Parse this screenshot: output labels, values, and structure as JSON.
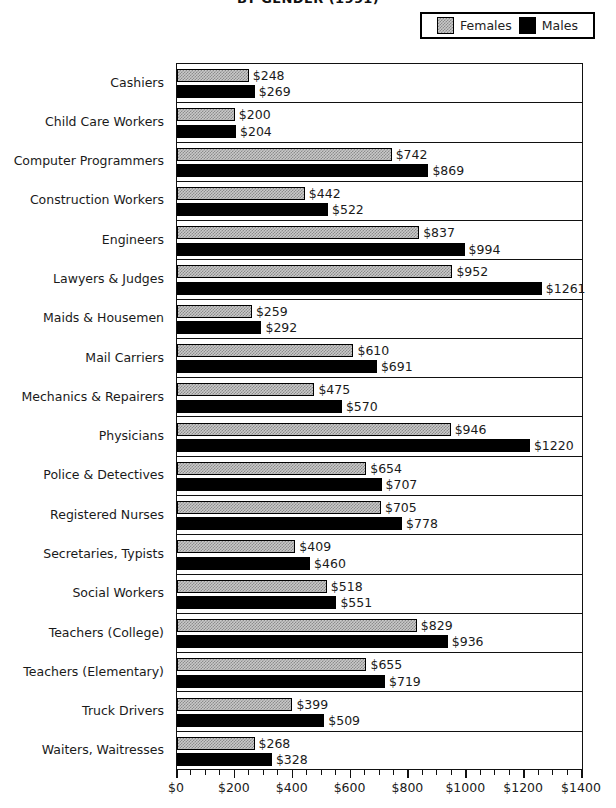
{
  "chart_data": {
    "type": "bar",
    "orientation": "horizontal",
    "title": "BY GENDER (1991)",
    "xlabel": "",
    "ylabel": "",
    "xlim": [
      0,
      1400
    ],
    "x_ticks": [
      "$0",
      "$200",
      "$400",
      "$600",
      "$800",
      "$1000",
      "$1200",
      "$1400"
    ],
    "x_tick_values": [
      0,
      200,
      400,
      600,
      800,
      1000,
      1200,
      1400
    ],
    "minor_tick_step": 50,
    "grid": false,
    "legend_position": "top-right",
    "value_prefix": "$",
    "categories": [
      "Cashiers",
      "Child Care Workers",
      "Computer Programmers",
      "Construction Workers",
      "Engineers",
      "Lawyers & Judges",
      "Maids & Housemen",
      "Mail Carriers",
      "Mechanics & Repairers",
      "Physicians",
      "Police & Detectives",
      "Registered Nurses",
      "Secretaries, Typists",
      "Social Workers",
      "Teachers (College)",
      "Teachers (Elementary)",
      "Truck Drivers",
      "Waiters, Waitresses"
    ],
    "series": [
      {
        "name": "Females",
        "color": "#c9c9c9",
        "values": [
          248,
          200,
          742,
          442,
          837,
          952,
          259,
          610,
          475,
          946,
          654,
          705,
          409,
          518,
          829,
          655,
          399,
          268
        ],
        "labels": [
          "$248",
          "$200",
          "$742",
          "$442",
          "$837",
          "$952",
          "$259",
          "$610",
          "$475",
          "$946",
          "$654",
          "$705",
          "$409",
          "$518",
          "$829",
          "$655",
          "$399",
          "$268"
        ]
      },
      {
        "name": "Males",
        "color": "#000000",
        "values": [
          269,
          204,
          869,
          522,
          994,
          1261,
          292,
          691,
          570,
          1220,
          707,
          778,
          460,
          551,
          936,
          719,
          509,
          328
        ],
        "labels": [
          "$269",
          "$204",
          "$869",
          "$522",
          "$994",
          "$1261",
          "$292",
          "$691",
          "$570",
          "$1220",
          "$707",
          "$778",
          "$460",
          "$551",
          "$936",
          "$719",
          "$509",
          "$328"
        ]
      }
    ]
  },
  "legend": {
    "items": [
      {
        "label": "Females",
        "swatch": "female-swatch"
      },
      {
        "label": "Males",
        "swatch": "male-swatch"
      }
    ]
  }
}
